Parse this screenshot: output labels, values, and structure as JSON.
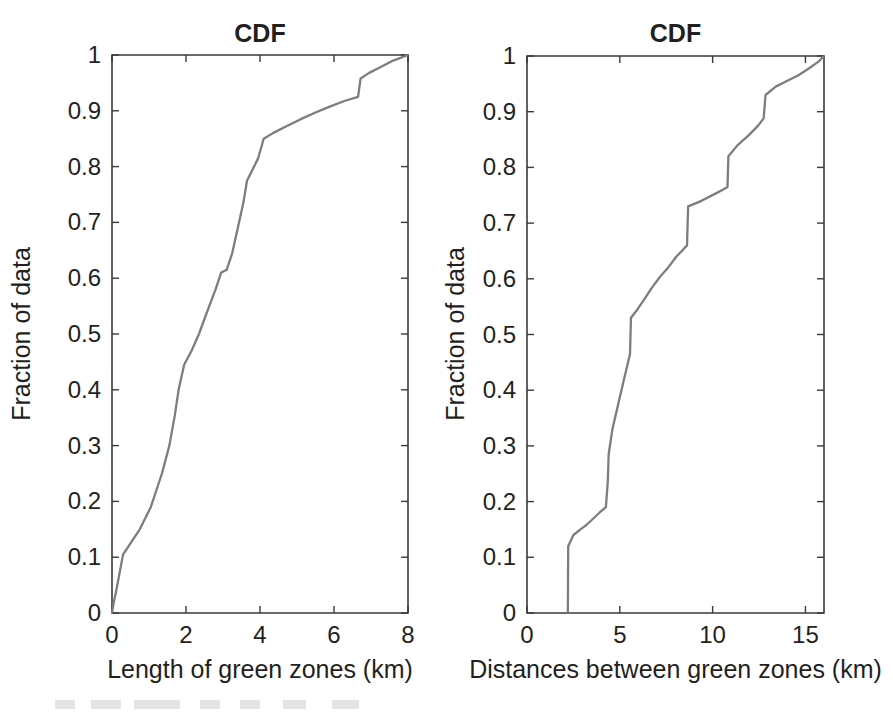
{
  "figure": {
    "background_color": "#ffffff",
    "axis_color": "#3a3a3a",
    "curve_color": "#7d7d7d",
    "text_color": "#231f20"
  },
  "panels": [
    {
      "id": "left",
      "title": "CDF",
      "xlabel": "Length of green zones (km)",
      "ylabel": "Fraction of data"
    },
    {
      "id": "right",
      "title": "CDF",
      "xlabel": "Distances between green zones (km)",
      "ylabel": "Fraction of data"
    }
  ],
  "chart_data": [
    {
      "type": "line",
      "title": "CDF",
      "xlabel": "Length of green zones (km)",
      "ylabel": "Fraction of data",
      "xlim": [
        0,
        8
      ],
      "ylim": [
        0,
        1
      ],
      "xticks": [
        0,
        2,
        4,
        6,
        8
      ],
      "xtick_labels": [
        "0",
        "2",
        "4",
        "6",
        "8"
      ],
      "yticks": [
        0,
        0.1,
        0.2,
        0.3,
        0.4,
        0.5,
        0.6,
        0.7,
        0.8,
        0.9,
        1
      ],
      "ytick_labels": [
        "0",
        "0.1",
        "0.2",
        "0.3",
        "0.4",
        "0.5",
        "0.6",
        "0.7",
        "0.8",
        "0.9",
        "1"
      ],
      "grid": false,
      "legend": null,
      "series": [
        {
          "name": "Length of green zones CDF",
          "color": "#7d7d7d",
          "x": [
            0.0,
            0.05,
            0.1,
            0.3,
            0.4,
            0.75,
            1.05,
            1.35,
            1.55,
            1.7,
            1.8,
            1.95,
            2.15,
            2.35,
            2.6,
            2.8,
            2.95,
            3.1,
            3.25,
            3.4,
            3.55,
            3.65,
            3.8,
            3.95,
            4.1,
            4.35,
            4.7,
            5.1,
            5.5,
            5.9,
            6.3,
            6.65,
            6.72,
            6.95,
            7.25,
            7.6,
            8.0
          ],
          "y": [
            0.0,
            0.02,
            0.035,
            0.105,
            0.115,
            0.15,
            0.19,
            0.25,
            0.3,
            0.355,
            0.4,
            0.445,
            0.47,
            0.5,
            0.545,
            0.58,
            0.61,
            0.615,
            0.645,
            0.69,
            0.735,
            0.775,
            0.795,
            0.815,
            0.85,
            0.86,
            0.872,
            0.885,
            0.897,
            0.908,
            0.918,
            0.925,
            0.958,
            0.968,
            0.978,
            0.99,
            1.0
          ]
        }
      ]
    },
    {
      "type": "line",
      "title": "CDF",
      "xlabel": "Distances between green zones (km)",
      "ylabel": "Fraction of data",
      "xlim": [
        0,
        16
      ],
      "ylim": [
        0,
        1
      ],
      "xticks": [
        0,
        5,
        10,
        15
      ],
      "xtick_labels": [
        "0",
        "5",
        "10",
        "15"
      ],
      "yticks": [
        0,
        0.1,
        0.2,
        0.3,
        0.4,
        0.5,
        0.6,
        0.7,
        0.8,
        0.9,
        1
      ],
      "ytick_labels": [
        "0",
        "0.1",
        "0.2",
        "0.3",
        "0.4",
        "0.5",
        "0.6",
        "0.7",
        "0.8",
        "0.9",
        "1"
      ],
      "grid": false,
      "legend": null,
      "series": [
        {
          "name": "Distances between green zones CDF",
          "color": "#7d7d7d",
          "x": [
            2.2,
            2.22,
            2.5,
            2.95,
            3.2,
            3.9,
            4.25,
            4.35,
            4.4,
            4.6,
            4.95,
            5.3,
            5.55,
            5.6,
            5.95,
            6.35,
            6.75,
            7.2,
            7.6,
            8.05,
            8.4,
            8.62,
            8.68,
            9.4,
            10.1,
            10.55,
            10.8,
            10.85,
            11.35,
            11.95,
            12.45,
            12.75,
            12.85,
            13.4,
            14.0,
            14.6,
            15.2,
            15.7,
            16.0
          ],
          "y": [
            0.0,
            0.12,
            0.14,
            0.152,
            0.158,
            0.18,
            0.19,
            0.235,
            0.285,
            0.33,
            0.38,
            0.43,
            0.465,
            0.53,
            0.545,
            0.565,
            0.585,
            0.605,
            0.62,
            0.64,
            0.652,
            0.66,
            0.73,
            0.74,
            0.752,
            0.76,
            0.765,
            0.82,
            0.84,
            0.858,
            0.875,
            0.888,
            0.93,
            0.945,
            0.955,
            0.965,
            0.978,
            0.99,
            1.0
          ]
        }
      ]
    }
  ]
}
